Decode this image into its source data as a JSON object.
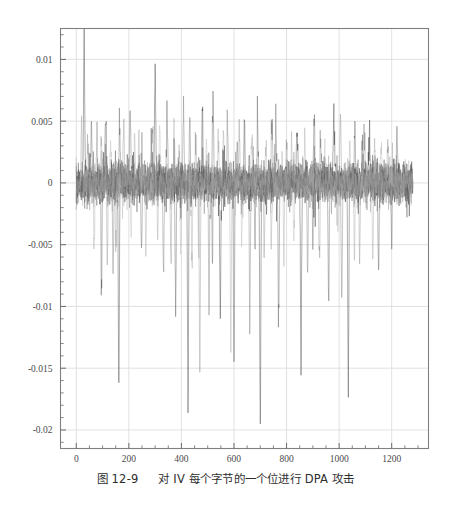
{
  "figure": {
    "caption_prefix": "图 12-9",
    "caption_text": "对 IV 每个字节的一个位进行 DPA 攻击",
    "caption_full": "图 12-9    对 IV 每个字节的一个位进行 DPA 攻击"
  },
  "colors": {
    "background": "#ffffff",
    "frame": "#808080",
    "grid": "#d9d9d9",
    "tick": "#6b6b6b",
    "tick_label": "#4a4a4a",
    "caption_text": "#2e2e2e",
    "trace_dark": "#2b2b2b",
    "trace_mid": "#6e6e6e",
    "trace_light": "#a8a8a8"
  },
  "chart_data": {
    "type": "line",
    "title": "",
    "xlabel": "",
    "ylabel": "",
    "xlim": [
      -60,
      1340
    ],
    "ylim": [
      -0.0215,
      0.0125
    ],
    "grid": true,
    "legend": false,
    "legend_position": "none",
    "x_ticks": [
      0,
      200,
      400,
      600,
      800,
      1000,
      1200
    ],
    "x_tick_labels": [
      "0",
      "200",
      "400",
      "600",
      "800",
      "1000",
      "1200"
    ],
    "x_minor_tick_step": 50,
    "y_ticks": [
      0.01,
      0.005,
      0,
      -0.005,
      -0.01,
      -0.015,
      -0.02
    ],
    "y_tick_labels": [
      "0.01",
      "0.005",
      "0",
      "-0.005",
      "-0.01",
      "-0.015",
      "-0.02"
    ],
    "y_minor_tick_step": 0.001,
    "n_series": 8,
    "series_description": "Eight overlaid DPA differential correlation traces, grayscale, sample index 0-1280",
    "noise_band": [
      -0.0022,
      0.0022
    ],
    "series": [
      {
        "name": "trace-1",
        "shade": "#2b2b2b",
        "noise_amp": 0.0018,
        "seed": 11,
        "peaks": [
          {
            "x": 30,
            "y": 0.0115
          },
          {
            "x": 112,
            "y": 0.0062
          },
          {
            "x": 300,
            "y": 0.0092
          },
          {
            "x": 480,
            "y": 0.0058
          },
          {
            "x": 640,
            "y": 0.005
          },
          {
            "x": 840,
            "y": 0.0048
          },
          {
            "x": 980,
            "y": 0.0062
          },
          {
            "x": 1115,
            "y": 0.004
          }
        ],
        "troughs": [
          {
            "x": 162,
            "y": -0.0163
          },
          {
            "x": 425,
            "y": -0.0178
          },
          {
            "x": 548,
            "y": -0.0108
          },
          {
            "x": 700,
            "y": -0.0196
          },
          {
            "x": 855,
            "y": -0.0152
          },
          {
            "x": 1035,
            "y": -0.0168
          }
        ]
      },
      {
        "name": "trace-2",
        "shade": "#4d4d4d",
        "noise_amp": 0.0016,
        "seed": 23,
        "peaks": [
          {
            "x": 58,
            "y": 0.0048
          },
          {
            "x": 205,
            "y": 0.006
          },
          {
            "x": 345,
            "y": 0.0055
          },
          {
            "x": 520,
            "y": 0.0072
          },
          {
            "x": 690,
            "y": 0.0046
          },
          {
            "x": 905,
            "y": 0.0058
          },
          {
            "x": 1060,
            "y": 0.0044
          },
          {
            "x": 1220,
            "y": 0.0036
          }
        ],
        "troughs": [
          {
            "x": 96,
            "y": -0.0088
          },
          {
            "x": 378,
            "y": -0.0104
          },
          {
            "x": 600,
            "y": -0.015
          },
          {
            "x": 770,
            "y": -0.0122
          },
          {
            "x": 960,
            "y": -0.0094
          },
          {
            "x": 1150,
            "y": -0.0072
          }
        ]
      },
      {
        "name": "trace-3",
        "shade": "#6e6e6e",
        "noise_amp": 0.0017,
        "seed": 37,
        "peaks": [
          {
            "x": 78,
            "y": 0.0042
          },
          {
            "x": 250,
            "y": 0.0038
          },
          {
            "x": 408,
            "y": 0.006
          },
          {
            "x": 575,
            "y": 0.0044
          },
          {
            "x": 745,
            "y": 0.0052
          },
          {
            "x": 930,
            "y": 0.004
          },
          {
            "x": 1095,
            "y": 0.0048
          }
        ],
        "troughs": [
          {
            "x": 140,
            "y": -0.007
          },
          {
            "x": 332,
            "y": -0.0082
          },
          {
            "x": 505,
            "y": -0.0098
          },
          {
            "x": 660,
            "y": -0.011
          },
          {
            "x": 880,
            "y": -0.0076
          },
          {
            "x": 1010,
            "y": -0.009
          }
        ]
      },
      {
        "name": "trace-4",
        "shade": "#8a8a8a",
        "noise_amp": 0.0015,
        "seed": 53,
        "peaks": [
          {
            "x": 44,
            "y": 0.0036
          },
          {
            "x": 180,
            "y": 0.005
          },
          {
            "x": 290,
            "y": 0.0044
          },
          {
            "x": 455,
            "y": 0.0038
          },
          {
            "x": 620,
            "y": 0.0042
          },
          {
            "x": 800,
            "y": 0.0036
          },
          {
            "x": 1005,
            "y": 0.0054
          },
          {
            "x": 1185,
            "y": 0.0032
          }
        ],
        "troughs": [
          {
            "x": 118,
            "y": -0.006
          },
          {
            "x": 360,
            "y": -0.0064
          },
          {
            "x": 470,
            "y": -0.0156
          },
          {
            "x": 715,
            "y": -0.0058
          },
          {
            "x": 925,
            "y": -0.0066
          },
          {
            "x": 1078,
            "y": -0.0062
          }
        ]
      },
      {
        "name": "trace-5",
        "shade": "#a0a0a0",
        "noise_amp": 0.0016,
        "seed": 71,
        "peaks": [
          {
            "x": 95,
            "y": 0.004
          },
          {
            "x": 222,
            "y": 0.0034
          },
          {
            "x": 372,
            "y": 0.0046
          },
          {
            "x": 540,
            "y": 0.0038
          },
          {
            "x": 722,
            "y": 0.0034
          },
          {
            "x": 870,
            "y": 0.0042
          },
          {
            "x": 1040,
            "y": 0.0036
          }
        ],
        "troughs": [
          {
            "x": 68,
            "y": -0.0056
          },
          {
            "x": 265,
            "y": -0.005
          },
          {
            "x": 440,
            "y": -0.0062
          },
          {
            "x": 588,
            "y": -0.0128
          },
          {
            "x": 790,
            "y": -0.0054
          },
          {
            "x": 1128,
            "y": -0.0058
          }
        ]
      },
      {
        "name": "trace-6",
        "shade": "#b5b5b5",
        "noise_amp": 0.0014,
        "seed": 89,
        "peaks": [
          {
            "x": 130,
            "y": 0.0032
          },
          {
            "x": 318,
            "y": 0.0042
          },
          {
            "x": 495,
            "y": 0.003
          },
          {
            "x": 668,
            "y": 0.0038
          },
          {
            "x": 945,
            "y": 0.0034
          },
          {
            "x": 1160,
            "y": 0.003
          }
        ],
        "troughs": [
          {
            "x": 208,
            "y": -0.0048
          },
          {
            "x": 398,
            "y": -0.0052
          },
          {
            "x": 630,
            "y": -0.0046
          },
          {
            "x": 828,
            "y": -0.005
          },
          {
            "x": 995,
            "y": -0.0044
          }
        ]
      },
      {
        "name": "trace-7",
        "shade": "#595959",
        "noise_amp": 0.0015,
        "seed": 101,
        "peaks": [
          {
            "x": 165,
            "y": 0.0046
          },
          {
            "x": 285,
            "y": 0.0036
          },
          {
            "x": 432,
            "y": 0.005
          },
          {
            "x": 612,
            "y": 0.0032
          },
          {
            "x": 760,
            "y": 0.0044
          },
          {
            "x": 1088,
            "y": 0.0038
          }
        ],
        "troughs": [
          {
            "x": 248,
            "y": -0.0054
          },
          {
            "x": 518,
            "y": -0.0058
          },
          {
            "x": 680,
            "y": -0.005
          },
          {
            "x": 900,
            "y": -0.0056
          },
          {
            "x": 1200,
            "y": -0.0048
          }
        ]
      },
      {
        "name": "trace-8",
        "shade": "#9a9a9a",
        "noise_amp": 0.0016,
        "seed": 127,
        "peaks": [
          {
            "x": 20,
            "y": 0.0038
          },
          {
            "x": 238,
            "y": 0.0042
          },
          {
            "x": 392,
            "y": 0.0034
          },
          {
            "x": 560,
            "y": 0.004
          },
          {
            "x": 820,
            "y": 0.0036
          },
          {
            "x": 1135,
            "y": 0.0034
          }
        ],
        "troughs": [
          {
            "x": 150,
            "y": -0.0052
          },
          {
            "x": 310,
            "y": -0.0046
          },
          {
            "x": 466,
            "y": -0.0056
          },
          {
            "x": 742,
            "y": -0.005
          },
          {
            "x": 1058,
            "y": -0.0052
          }
        ]
      }
    ]
  }
}
